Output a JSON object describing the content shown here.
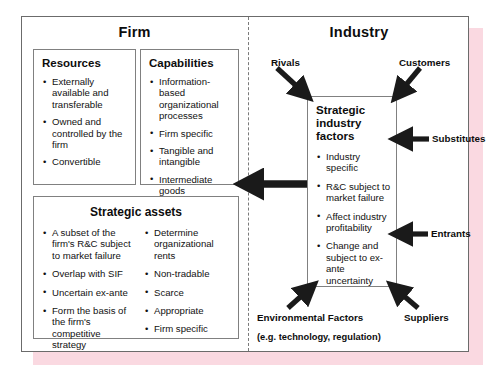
{
  "diagram": {
    "title_left": "Firm",
    "title_right": "Industry"
  },
  "firm": {
    "resources": {
      "heading": "Resources",
      "bullets": [
        "Externally available and transferable",
        "Owned and controlled by the firm",
        "Convertible"
      ]
    },
    "capabilities": {
      "heading": "Capabilities",
      "bullets": [
        "Information-based organizational processes",
        "Firm specific",
        "Tangible and intangible",
        "Intermediate goods"
      ]
    },
    "strategic_assets": {
      "heading": "Strategic assets",
      "bullets_left": [
        "A subset of the firm's R&C subject to market failure",
        "Overlap with SIF",
        "Uncertain ex-ante",
        "Form the basis of the firm's competitive strategy"
      ],
      "bullets_right": [
        "Determine organizational rents",
        "Non-tradable",
        "Scarce",
        "Appropriate",
        "Firm specific"
      ]
    }
  },
  "industry": {
    "strategic_industry_factors": {
      "heading": "Strategic industry factors",
      "bullets": [
        "Industry specific",
        "R&C subject to market failure",
        "Affect industry profitability",
        "Change and subject to ex-ante uncertainty"
      ]
    },
    "forces": [
      {
        "label": "Rivals",
        "direction": "down-right"
      },
      {
        "label": "Customers",
        "direction": "down-left"
      },
      {
        "label": "Substitutes",
        "direction": "left"
      },
      {
        "label": "Entrants",
        "direction": "left"
      },
      {
        "label": "Suppliers",
        "direction": "up-left"
      }
    ],
    "environmental_factors": {
      "label": "Environmental Factors",
      "sublabel": "(e.g. technology, regulation)",
      "direction": "up-right"
    }
  },
  "connector": {
    "name": "industry-to-firm-arrow",
    "direction": "left"
  },
  "colors": {
    "frame_border": "#6b6b6b",
    "card_border": "#808080",
    "shadow_pink": "#f9d2dc",
    "arrow_fill": "#1a1a1a",
    "text": "#111111"
  }
}
